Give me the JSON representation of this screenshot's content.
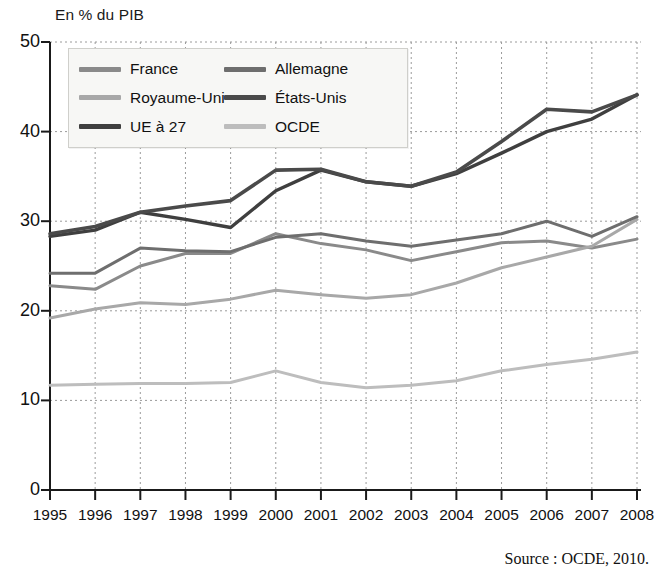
{
  "figure": {
    "axis_title": "En % du PIB",
    "source": "Source : OCDE, 2010."
  },
  "legend": {
    "items": [
      {
        "label": "France",
        "color": "#8a8a8a",
        "column": 0,
        "row": 0
      },
      {
        "label": "Royaume-Uni",
        "color": "#a8a8a8",
        "column": 0,
        "row": 1
      },
      {
        "label": "UE à 27",
        "color": "#3f3f3f",
        "column": 0,
        "row": 2
      },
      {
        "label": "Allemagne",
        "color": "#6e6e6e",
        "column": 1,
        "row": 0
      },
      {
        "label": "États-Unis",
        "color": "#4a4a4a",
        "column": 1,
        "row": 1
      },
      {
        "label": "OCDE",
        "color": "#bdbdbd",
        "column": 1,
        "row": 2
      }
    ]
  },
  "chart_data": {
    "type": "line",
    "title": "",
    "subtitle": "",
    "xlabel": "",
    "ylabel": "En % du PIB",
    "ylim": [
      0,
      50
    ],
    "ytick_values": [
      0,
      10,
      20,
      30,
      40,
      50
    ],
    "ytick_labels": [
      "0",
      "10",
      "20",
      "30",
      "40",
      "50"
    ],
    "grid": true,
    "grid_style": "dotted",
    "legend_position": "top-left-inside",
    "categories": [
      "1995",
      "1996",
      "1997",
      "1998",
      "1999",
      "2000",
      "2001",
      "2002",
      "2003",
      "2004",
      "2005",
      "2006",
      "2007",
      "2008"
    ],
    "x": [
      1995,
      1996,
      1997,
      1998,
      1999,
      2000,
      2001,
      2002,
      2003,
      2004,
      2005,
      2006,
      2007,
      2008
    ],
    "series": [
      {
        "name": "France",
        "color": "#8a8a8a",
        "width": 3.0,
        "values": [
          22.8,
          22.4,
          25.0,
          26.4,
          26.4,
          28.6,
          27.5,
          26.8,
          25.6,
          26.6,
          27.6,
          27.8,
          27.0,
          28.0
        ]
      },
      {
        "name": "Royaume-Uni",
        "color": "#a8a8a8",
        "width": 3.0,
        "values": [
          19.2,
          20.2,
          20.9,
          20.7,
          21.3,
          22.3,
          21.8,
          21.4,
          21.8,
          23.1,
          24.8,
          26.0,
          27.2,
          30.2
        ]
      },
      {
        "name": "UE à 27",
        "color": "#3f3f3f",
        "width": 3.4,
        "values": [
          28.3,
          29.0,
          31.0,
          30.2,
          29.3,
          33.4,
          35.7,
          34.4,
          33.9,
          35.3,
          37.6,
          40.0,
          41.4,
          44.1
        ]
      },
      {
        "name": "Allemagne",
        "color": "#6e6e6e",
        "width": 3.0,
        "values": [
          24.2,
          24.2,
          27.0,
          26.7,
          26.6,
          28.2,
          28.6,
          27.8,
          27.2,
          27.9,
          28.6,
          30.0,
          28.3,
          30.5
        ]
      },
      {
        "name": "États-Unis",
        "color": "#4a4a4a",
        "width": 3.6,
        "values": [
          28.6,
          29.4,
          31.0,
          31.7,
          32.3,
          35.7,
          35.8,
          34.4,
          33.9,
          35.5,
          38.9,
          42.5,
          42.2,
          44.1
        ]
      },
      {
        "name": "OCDE",
        "color": "#bdbdbd",
        "width": 3.0,
        "values": [
          11.7,
          11.8,
          11.9,
          11.9,
          12.0,
          13.3,
          12.0,
          11.4,
          11.7,
          12.2,
          13.3,
          14.0,
          14.6,
          15.4
        ]
      }
    ]
  }
}
